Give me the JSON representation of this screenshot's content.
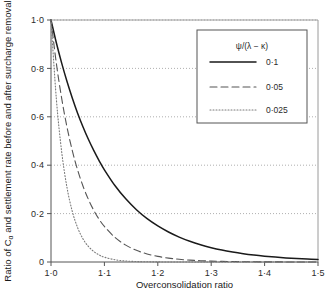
{
  "chart_data": {
    "type": "line",
    "title": "",
    "xlabel": "Overconsolidation ratio",
    "ylabel": "Ratio of Cα and settlement rate before and after surcharge removal",
    "xlim": [
      1.0,
      1.5
    ],
    "ylim": [
      0,
      1.0
    ],
    "xticks": [
      "1·0",
      "1·1",
      "1·2",
      "1·3",
      "1·4",
      "1·5"
    ],
    "xtick_values": [
      1.0,
      1.1,
      1.2,
      1.3,
      1.4,
      1.5
    ],
    "yticks": [
      "0",
      "0·2",
      "0·4",
      "0·6",
      "0·8",
      "1·0"
    ],
    "ytick_values": [
      0,
      0.2,
      0.4,
      0.6,
      0.8,
      1.0
    ],
    "grid": "horizontal-dotted",
    "legend_position": "top-right",
    "legend_title": "ψ/(λ − κ)",
    "x": [
      1.0,
      1.01,
      1.02,
      1.03,
      1.04,
      1.05,
      1.06,
      1.07,
      1.08,
      1.09,
      1.1,
      1.12,
      1.14,
      1.16,
      1.18,
      1.2,
      1.22,
      1.24,
      1.26,
      1.28,
      1.3,
      1.32,
      1.34,
      1.36,
      1.38,
      1.4,
      1.42,
      1.44,
      1.46,
      1.48,
      1.5
    ],
    "series": [
      {
        "name": "0·1",
        "label": "0·1",
        "style": "solid",
        "color": "#1a1a1a",
        "values": [
          1.0,
          0.906,
          0.822,
          0.746,
          0.677,
          0.614,
          0.558,
          0.507,
          0.461,
          0.419,
          0.381,
          0.315,
          0.261,
          0.216,
          0.179,
          0.149,
          0.124,
          0.103,
          0.0856,
          0.0712,
          0.0593,
          0.0494,
          0.0413,
          0.0345,
          0.0288,
          0.0241,
          0.0202,
          0.0169,
          0.0142,
          0.0119,
          0.01
        ]
      },
      {
        "name": "0·05",
        "label": "0·05",
        "style": "dashed",
        "color": "#555555",
        "values": [
          1.0,
          0.821,
          0.676,
          0.557,
          0.459,
          0.379,
          0.313,
          0.259,
          0.214,
          0.177,
          0.147,
          0.101,
          0.0697,
          0.0481,
          0.0333,
          0.0231,
          0.016,
          0.0111,
          0.0077,
          0.0054,
          0.0037,
          0.0026,
          0.0018,
          0.0013,
          0.0009,
          0.0006,
          0.0004,
          0.0003,
          0.0002,
          0.0002,
          0.0001
        ]
      },
      {
        "name": "0·025",
        "label": "0·025",
        "style": "dotted",
        "color": "#7a7a7a",
        "values": [
          1.0,
          0.674,
          0.455,
          0.307,
          0.208,
          0.141,
          0.0952,
          0.0644,
          0.0436,
          0.0295,
          0.02,
          0.00916,
          0.0042,
          0.00193,
          0.00089,
          0.00041,
          0.00019,
          9e-05,
          4e-05,
          2e-05,
          1e-05,
          0.0,
          0.0,
          0.0,
          0.0,
          0.0,
          0.0,
          0.0,
          0.0,
          0.0,
          0.0
        ]
      }
    ]
  }
}
